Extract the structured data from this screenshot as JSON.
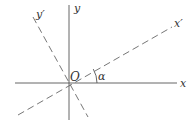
{
  "diagram": {
    "labels": {
      "x": "x",
      "y": "y",
      "x_prime": "x′",
      "y_prime": "y′",
      "origin": "O",
      "angle": "α"
    },
    "colors": {
      "axis": "#555555",
      "rotated_axis": "#666666",
      "text": "#333333",
      "background": "#ffffff"
    },
    "axes": {
      "x_axis": {
        "from": [
          15,
          83
        ],
        "to": [
          177,
          83
        ],
        "style": "solid"
      },
      "y_axis": {
        "from": [
          69,
          5
        ],
        "to": [
          69,
          120
        ],
        "style": "solid"
      },
      "x_prime_axis": {
        "from": [
          18,
          115
        ],
        "to": [
          172,
          27
        ],
        "style": "dashed"
      },
      "y_prime_axis": {
        "from": [
          33,
          17
        ],
        "to": [
          88,
          117
        ],
        "style": "dashed"
      }
    },
    "angle_arc": {
      "center": [
        69,
        83
      ],
      "radius": 28,
      "between": [
        "x",
        "x′"
      ]
    }
  }
}
